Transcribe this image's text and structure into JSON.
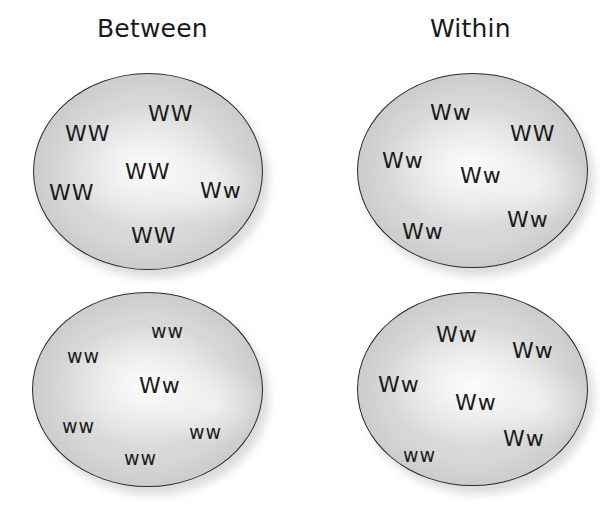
{
  "diagram": {
    "columns": [
      {
        "title": "Between"
      },
      {
        "title": "Within"
      }
    ],
    "populations": [
      {
        "column": "Between",
        "row": 1,
        "genotypes": [
          {
            "label": "WW",
            "x": 115,
            "y": 30
          },
          {
            "label": "WW",
            "x": 32,
            "y": 50
          },
          {
            "label": "WW",
            "x": 92,
            "y": 88
          },
          {
            "label": "WW",
            "x": 16,
            "y": 109
          },
          {
            "label": "Ww",
            "x": 167,
            "y": 107
          },
          {
            "label": "WW",
            "x": 98,
            "y": 152
          }
        ]
      },
      {
        "column": "Within",
        "row": 1,
        "genotypes": [
          {
            "label": "Ww",
            "x": 73,
            "y": 29
          },
          {
            "label": "WW",
            "x": 153,
            "y": 50
          },
          {
            "label": "Ww",
            "x": 25,
            "y": 77
          },
          {
            "label": "Ww",
            "x": 103,
            "y": 92
          },
          {
            "label": "Ww",
            "x": 150,
            "y": 136
          },
          {
            "label": "Ww",
            "x": 45,
            "y": 148
          }
        ]
      },
      {
        "column": "Between",
        "row": 2,
        "genotypes": [
          {
            "label": "ww",
            "x": 119,
            "y": 30
          },
          {
            "label": "ww",
            "x": 35,
            "y": 55
          },
          {
            "label": "Ww",
            "x": 107,
            "y": 85
          },
          {
            "label": "ww",
            "x": 30,
            "y": 125
          },
          {
            "label": "ww",
            "x": 157,
            "y": 131
          },
          {
            "label": "ww",
            "x": 92,
            "y": 157
          }
        ]
      },
      {
        "column": "Within",
        "row": 2,
        "genotypes": [
          {
            "label": "Ww",
            "x": 79,
            "y": 32
          },
          {
            "label": "Ww",
            "x": 155,
            "y": 48
          },
          {
            "label": "Ww",
            "x": 21,
            "y": 82
          },
          {
            "label": "Ww",
            "x": 98,
            "y": 100
          },
          {
            "label": "Ww",
            "x": 146,
            "y": 136
          },
          {
            "label": "ww",
            "x": 46,
            "y": 154
          }
        ]
      }
    ],
    "colors": {
      "background": "#ffffff",
      "ellipse_fill": "#d6d6d6",
      "ellipse_border": "#2b2b2b",
      "text": "#1c1c1c"
    }
  }
}
